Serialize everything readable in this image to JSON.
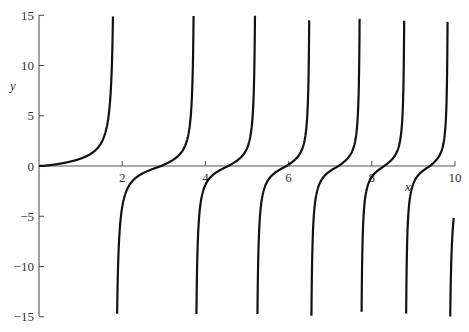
{
  "chart_data": {
    "type": "line",
    "title": "",
    "xlabel": "x",
    "ylabel": "y",
    "xlim": [
      0,
      10
    ],
    "ylim": [
      -15,
      15
    ],
    "grid": false,
    "legend": null,
    "x_ticks": [
      2,
      4,
      6,
      8,
      10
    ],
    "x_tick_labels": [
      "2",
      "4",
      "6",
      "8",
      "10"
    ],
    "y_ticks": [
      15,
      10,
      5,
      0,
      -5,
      -10,
      -15
    ],
    "y_tick_labels": [
      "15",
      "10",
      "5",
      "0",
      "−5",
      "−10",
      "−15"
    ],
    "series": [
      {
        "name": "y",
        "description": "tangent-like curve with vertical asymptotes of decreasing spacing",
        "asymptotes_x": [
          1.83,
          3.75,
          5.22,
          6.52,
          7.73,
          8.8,
          9.84
        ],
        "zero_crossings_x": [
          0,
          2.94,
          4.55,
          5.95,
          7.2,
          8.3,
          9.4
        ],
        "color": "#111111"
      }
    ]
  }
}
